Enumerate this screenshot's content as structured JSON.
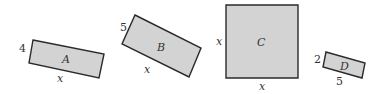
{
  "rectangles": [
    {
      "name": "A",
      "side_label": "4",
      "bottom_label": "x"
    },
    {
      "name": "B",
      "side_label": "5",
      "bottom_label": "x"
    },
    {
      "name": "C",
      "side_label": "x",
      "bottom_label": "x"
    },
    {
      "name": "D",
      "side_label": "2",
      "bottom_label": "5"
    }
  ],
  "colors": {
    "fill": "#d3d3d3",
    "stroke": "#2a2a2a"
  }
}
